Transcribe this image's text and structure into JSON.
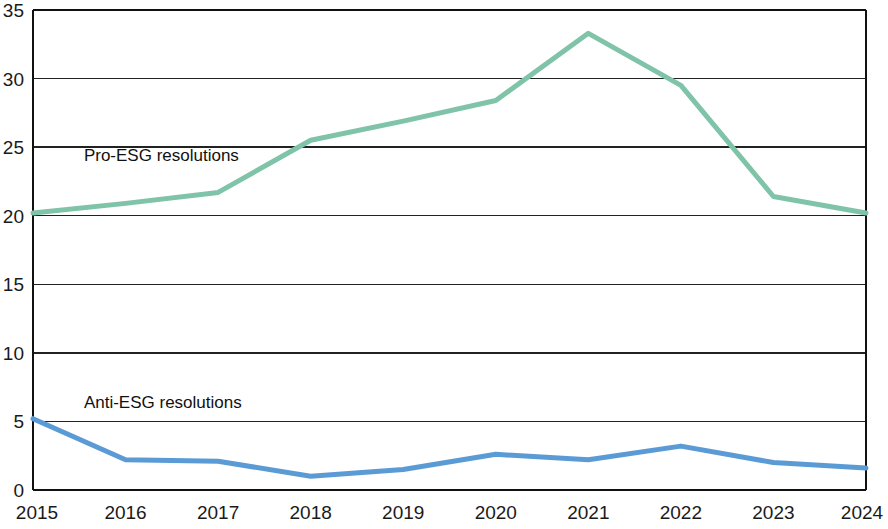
{
  "chart_data": {
    "type": "line",
    "title": "",
    "subtitle": "",
    "xlabel": "",
    "ylabel": "",
    "categories": [
      "2015",
      "2016",
      "2017",
      "2018",
      "2019",
      "2020",
      "2021",
      "2022",
      "2023",
      "2024"
    ],
    "x": [
      2015,
      2016,
      2017,
      2018,
      2019,
      2020,
      2021,
      2022,
      2023,
      2024
    ],
    "xlim": [
      2015,
      2024
    ],
    "ylim": [
      0,
      35
    ],
    "y_ticks": [
      0,
      5,
      10,
      15,
      20,
      25,
      30,
      35
    ],
    "y_tick_labels": [
      "0",
      "5",
      "10",
      "15",
      "20",
      "25",
      "30",
      "35"
    ],
    "grid": true,
    "grid_axis": "y",
    "legend": "inline-annotations",
    "series": [
      {
        "name": "Pro-ESG resolutions",
        "color": "#7fc4a8",
        "values": [
          20.2,
          20.9,
          21.7,
          25.5,
          26.9,
          28.4,
          33.3,
          29.5,
          21.4,
          20.2
        ]
      },
      {
        "name": "Anti-ESG resolutions",
        "color": "#5b9bd5",
        "values": [
          5.2,
          2.2,
          2.1,
          1.0,
          1.5,
          2.6,
          2.2,
          3.2,
          2.0,
          1.6
        ]
      }
    ],
    "annotations": [
      {
        "id": "pro-esg-label",
        "text": "Pro-ESG resolutions",
        "x": 2015.55,
        "y": 24.0
      },
      {
        "id": "anti-esg-label",
        "text": "Anti-ESG resolutions",
        "x": 2015.55,
        "y": 6.0
      }
    ]
  },
  "axes": {
    "y_label_0": "0",
    "y_label_5": "5",
    "y_label_10": "10",
    "y_label_15": "15",
    "y_label_20": "20",
    "y_label_25": "25",
    "y_label_30": "30",
    "y_label_35": "35",
    "x_label_2015": "2015",
    "x_label_2016": "2016",
    "x_label_2017": "2017",
    "x_label_2018": "2018",
    "x_label_2019": "2019",
    "x_label_2020": "2020",
    "x_label_2021": "2021",
    "x_label_2022": "2022",
    "x_label_2023": "2023",
    "x_label_2024": "2024"
  },
  "series_labels": {
    "pro": "Pro-ESG resolutions",
    "anti": "Anti-ESG resolutions"
  },
  "colors": {
    "pro_esg": "#7fc4a8",
    "anti_esg": "#5b9bd5",
    "axis": "#111111",
    "grid": "#222222",
    "background": "#ffffff"
  }
}
